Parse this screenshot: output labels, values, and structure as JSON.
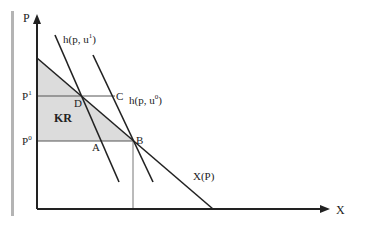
{
  "diagram": {
    "axes": {
      "y_label": "P",
      "x_label": "X"
    },
    "price_levels": [
      {
        "label": "P",
        "sup": "1",
        "name": "p1"
      },
      {
        "label": "P",
        "sup": "0",
        "name": "p0"
      }
    ],
    "curves": [
      {
        "label": "h(p, u",
        "sup": "1",
        "close": ")",
        "name": "hicksian-u1"
      },
      {
        "label": "h(p, u",
        "sup": "0",
        "close": ")",
        "name": "hicksian-u0"
      },
      {
        "label": "X(P)",
        "name": "marshallian-demand"
      }
    ],
    "points": {
      "A": "A",
      "B": "B",
      "C": "C",
      "D": "D"
    },
    "region_label": "KR",
    "colors": {
      "shade": "#dcdcdc",
      "line": "#222222",
      "guide": "#666666",
      "bar": "#b4b4b4"
    }
  }
}
